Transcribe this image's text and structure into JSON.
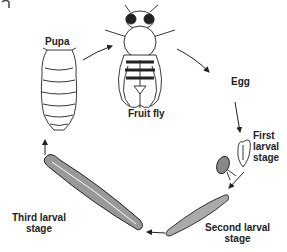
{
  "diagram": {
    "title_fragment": "g",
    "stages": [
      {
        "id": "pupa",
        "label": "Pupa"
      },
      {
        "id": "fruit-fly",
        "label": "Fruit fly"
      },
      {
        "id": "egg",
        "label": "Egg"
      },
      {
        "id": "first-larval",
        "label_line1": "First",
        "label_line2": "larval",
        "label_line3": "stage"
      },
      {
        "id": "second-larval",
        "label_line1": "Second larval",
        "label_line2": "stage"
      },
      {
        "id": "third-larval",
        "label_line1": "Third larval",
        "label_line2": "stage"
      }
    ],
    "cycle_order": [
      "Pupa",
      "Fruit fly",
      "Egg",
      "First larval stage",
      "Second larval stage",
      "Third larval stage"
    ],
    "colors": {
      "ink": "#222222",
      "background": "#ffffff"
    }
  }
}
